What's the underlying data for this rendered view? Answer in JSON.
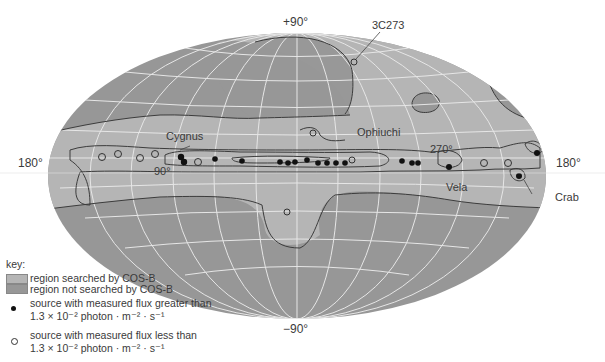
{
  "labels": {
    "north_pole": "+90°",
    "south_pole": "−90°",
    "left_edge": "180°",
    "right_edge": "180°",
    "lon_90": "90°",
    "lon_270": "270°"
  },
  "sources": {
    "cygnus": "Cygnus",
    "ophiuchi": "Ophiuchi",
    "vela": "Vela",
    "crab": "Crab",
    "c3c273": "3C273"
  },
  "key": {
    "title": "key:",
    "searched": "region searched by COS-B",
    "not_searched": "region not searched by COS-B",
    "greater_line1": "source with measured flux greater than",
    "greater_line2": "1.3 × 10⁻² photon · m⁻² · s⁻¹",
    "less_line1": "source with measured flux less than",
    "less_line2": "1.3 × 10⁻² photon · m⁻² · s⁻¹"
  },
  "colors": {
    "searched": "#b4b4b4",
    "not_searched": "#969696",
    "grid": "#e8e8e8",
    "contour": "#3c3c3c"
  }
}
